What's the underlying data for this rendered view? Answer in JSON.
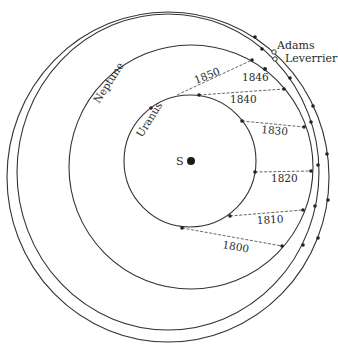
{
  "figure": {
    "sun_label": "S",
    "orbit_labels": {
      "uranus": "Uranus",
      "neptune": "Neptune",
      "adams": "Adams",
      "leverrier": "Leverrier"
    },
    "year_labels": [
      "1800",
      "1810",
      "1820",
      "1830",
      "1840",
      "1846",
      "1850"
    ],
    "colors": {
      "line": "#333333",
      "background": "#ffffff",
      "text": "#2a2a2a"
    }
  },
  "positions": [
    {
      "year": "1800",
      "label": "1800"
    },
    {
      "year": "1810",
      "label": "1810"
    },
    {
      "year": "1820",
      "label": "1820"
    },
    {
      "year": "1830",
      "label": "1830"
    },
    {
      "year": "1840",
      "label": "1840"
    },
    {
      "year": "1846",
      "label": "1846"
    },
    {
      "year": "1850",
      "label": "1850"
    }
  ]
}
